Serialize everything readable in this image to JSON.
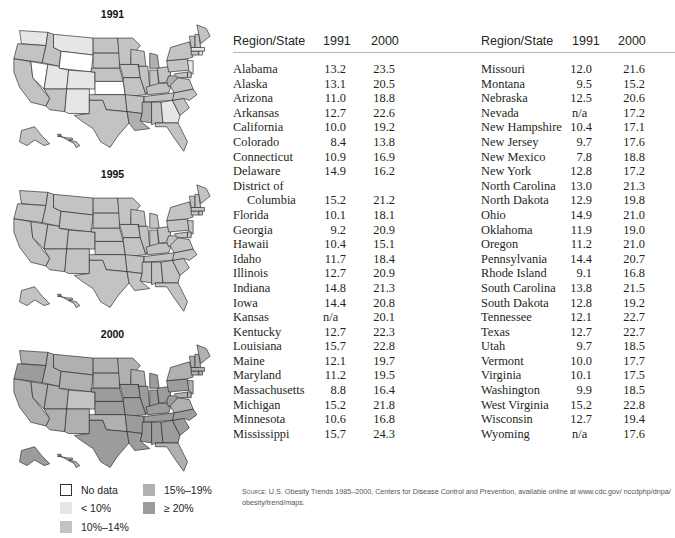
{
  "chart_data": [
    {
      "type": "heatmap",
      "title": "1991",
      "description": "Choropleth map of U.S. obesity prevalence by state, 1991",
      "legend": [
        "No data",
        "< 10%",
        "10%–14%",
        "15%–19%",
        "≥ 20%"
      ]
    },
    {
      "type": "heatmap",
      "title": "1995",
      "description": "Choropleth map of U.S. obesity prevalence by state, 1995",
      "legend": [
        "No data",
        "< 10%",
        "10%–14%",
        "15%–19%",
        "≥ 20%"
      ]
    },
    {
      "type": "heatmap",
      "title": "2000",
      "description": "Choropleth map of U.S. obesity prevalence by state, 2000",
      "legend": [
        "No data",
        "< 10%",
        "10%–14%",
        "15%–19%",
        "≥ 20%"
      ]
    },
    {
      "type": "table",
      "columns": [
        "Region/State",
        "1991",
        "2000"
      ],
      "rows": [
        [
          "Alabama",
          "13.2",
          "23.5"
        ],
        [
          "Alaska",
          "13.1",
          "20.5"
        ],
        [
          "Arizona",
          "11.0",
          "18.8"
        ],
        [
          "Arkansas",
          "12.7",
          "22.6"
        ],
        [
          "California",
          "10.0",
          "19.2"
        ],
        [
          "Colorado",
          "8.4",
          "13.8"
        ],
        [
          "Connecticut",
          "10.9",
          "16.9"
        ],
        [
          "Delaware",
          "14.9",
          "16.2"
        ],
        [
          "District of Columbia",
          "15.2",
          "21.2"
        ],
        [
          "Florida",
          "10.1",
          "18.1"
        ],
        [
          "Georgia",
          "9.2",
          "20.9"
        ],
        [
          "Hawaii",
          "10.4",
          "15.1"
        ],
        [
          "Idaho",
          "11.7",
          "18.4"
        ],
        [
          "Illinois",
          "12.7",
          "20.9"
        ],
        [
          "Indiana",
          "14.8",
          "21.3"
        ],
        [
          "Iowa",
          "14.4",
          "20.8"
        ],
        [
          "Kansas",
          "n/a",
          "20.1"
        ],
        [
          "Kentucky",
          "12.7",
          "22.3"
        ],
        [
          "Louisiana",
          "15.7",
          "22.8"
        ],
        [
          "Maine",
          "12.1",
          "19.7"
        ],
        [
          "Maryland",
          "11.2",
          "19.5"
        ],
        [
          "Massachusetts",
          "8.8",
          "16.4"
        ],
        [
          "Michigan",
          "15.2",
          "21.8"
        ],
        [
          "Minnesota",
          "10.6",
          "16.8"
        ],
        [
          "Mississippi",
          "15.7",
          "24.3"
        ],
        [
          "Missouri",
          "12.0",
          "21.6"
        ],
        [
          "Montana",
          "9.5",
          "15.2"
        ],
        [
          "Nebraska",
          "12.5",
          "20.6"
        ],
        [
          "Nevada",
          "n/a",
          "17.2"
        ],
        [
          "New Hampshire",
          "10.4",
          "17.1"
        ],
        [
          "New Jersey",
          "9.7",
          "17.6"
        ],
        [
          "New Mexico",
          "7.8",
          "18.8"
        ],
        [
          "New York",
          "12.8",
          "17.2"
        ],
        [
          "North Carolina",
          "13.0",
          "21.3"
        ],
        [
          "North Dakota",
          "12.9",
          "19.8"
        ],
        [
          "Ohio",
          "14.9",
          "21.0"
        ],
        [
          "Oklahoma",
          "11.9",
          "19.0"
        ],
        [
          "Oregon",
          "11.2",
          "21.0"
        ],
        [
          "Pennsylvania",
          "14.4",
          "20.7"
        ],
        [
          "Rhode Island",
          "9.1",
          "16.8"
        ],
        [
          "South Carolina",
          "13.8",
          "21.5"
        ],
        [
          "South Dakota",
          "12.8",
          "19.2"
        ],
        [
          "Tennessee",
          "12.1",
          "22.7"
        ],
        [
          "Texas",
          "12.7",
          "22.7"
        ],
        [
          "Utah",
          "9.7",
          "18.5"
        ],
        [
          "Vermont",
          "10.0",
          "17.7"
        ],
        [
          "Virginia",
          "10.1",
          "17.5"
        ],
        [
          "Washington",
          "9.9",
          "18.5"
        ],
        [
          "West Virginia",
          "15.2",
          "22.8"
        ],
        [
          "Wisconsin",
          "12.7",
          "19.4"
        ],
        [
          "Wyoming",
          "n/a",
          "17.6"
        ]
      ]
    }
  ],
  "colors": {
    "no_data": "#ffffff",
    "lt10": "#e6e6e6",
    "p10_14": "#c3c3c3",
    "p15_19": "#b0b0b0",
    "ge20": "#9c9c9c",
    "border": "#2a2a2a"
  },
  "maps": [
    {
      "title": "1991"
    },
    {
      "title": "1995"
    },
    {
      "title": "2000"
    }
  ],
  "legend": {
    "items": [
      {
        "label": "No data"
      },
      {
        "label": "< 10%"
      },
      {
        "label": "10%–14%"
      },
      {
        "label": "15%–19%"
      },
      {
        "label": "≥ 20%"
      }
    ]
  },
  "table": {
    "headers": {
      "region": "Region/State",
      "y1991": "1991",
      "y2000": "2000"
    },
    "left": [
      {
        "name": "Alabama",
        "v1991": "13.2",
        "v2000": "23.5"
      },
      {
        "name": "Alaska",
        "v1991": "13.1",
        "v2000": "20.5"
      },
      {
        "name": "Arizona",
        "v1991": "11.0",
        "v2000": "18.8"
      },
      {
        "name": "Arkansas",
        "v1991": "12.7",
        "v2000": "22.6"
      },
      {
        "name": "California",
        "v1991": "10.0",
        "v2000": "19.2"
      },
      {
        "name": "Colorado",
        "v1991": "8.4",
        "v2000": "13.8"
      },
      {
        "name": "Connecticut",
        "v1991": "10.9",
        "v2000": "16.9"
      },
      {
        "name": "Delaware",
        "v1991": "14.9",
        "v2000": "16.2"
      },
      {
        "name": "District of",
        "v1991": "",
        "v2000": ""
      },
      {
        "name": "Columbia",
        "v1991": "15.2",
        "v2000": "21.2",
        "indent": true
      },
      {
        "name": "Florida",
        "v1991": "10.1",
        "v2000": "18.1"
      },
      {
        "name": "Georgia",
        "v1991": "9.2",
        "v2000": "20.9"
      },
      {
        "name": "Hawaii",
        "v1991": "10.4",
        "v2000": "15.1"
      },
      {
        "name": "Idaho",
        "v1991": "11.7",
        "v2000": "18.4"
      },
      {
        "name": "Illinois",
        "v1991": "12.7",
        "v2000": "20.9"
      },
      {
        "name": "Indiana",
        "v1991": "14.8",
        "v2000": "21.3"
      },
      {
        "name": "Iowa",
        "v1991": "14.4",
        "v2000": "20.8"
      },
      {
        "name": "Kansas",
        "v1991": "n/a",
        "v2000": "20.1"
      },
      {
        "name": "Kentucky",
        "v1991": "12.7",
        "v2000": "22.3"
      },
      {
        "name": "Louisiana",
        "v1991": "15.7",
        "v2000": "22.8"
      },
      {
        "name": "Maine",
        "v1991": "12.1",
        "v2000": "19.7"
      },
      {
        "name": "Maryland",
        "v1991": "11.2",
        "v2000": "19.5"
      },
      {
        "name": "Massachusetts",
        "v1991": "8.8",
        "v2000": "16.4"
      },
      {
        "name": "Michigan",
        "v1991": "15.2",
        "v2000": "21.8"
      },
      {
        "name": "Minnesota",
        "v1991": "10.6",
        "v2000": "16.8"
      },
      {
        "name": "Mississippi",
        "v1991": "15.7",
        "v2000": "24.3"
      }
    ],
    "right": [
      {
        "name": "Missouri",
        "v1991": "12.0",
        "v2000": "21.6"
      },
      {
        "name": "Montana",
        "v1991": "9.5",
        "v2000": "15.2"
      },
      {
        "name": "Nebraska",
        "v1991": "12.5",
        "v2000": "20.6"
      },
      {
        "name": "Nevada",
        "v1991": "n/a",
        "v2000": "17.2"
      },
      {
        "name": "New Hampshire",
        "v1991": "10.4",
        "v2000": "17.1"
      },
      {
        "name": "New Jersey",
        "v1991": "9.7",
        "v2000": "17.6"
      },
      {
        "name": "New Mexico",
        "v1991": "7.8",
        "v2000": "18.8"
      },
      {
        "name": "New York",
        "v1991": "12.8",
        "v2000": "17.2"
      },
      {
        "name": "North Carolina",
        "v1991": "13.0",
        "v2000": "21.3"
      },
      {
        "name": "North Dakota",
        "v1991": "12.9",
        "v2000": "19.8"
      },
      {
        "name": "Ohio",
        "v1991": "14.9",
        "v2000": "21.0"
      },
      {
        "name": "Oklahoma",
        "v1991": "11.9",
        "v2000": "19.0"
      },
      {
        "name": "Oregon",
        "v1991": "11.2",
        "v2000": "21.0"
      },
      {
        "name": "Pennsylvania",
        "v1991": "14.4",
        "v2000": "20.7"
      },
      {
        "name": "Rhode Island",
        "v1991": "9.1",
        "v2000": "16.8"
      },
      {
        "name": "South Carolina",
        "v1991": "13.8",
        "v2000": "21.5"
      },
      {
        "name": "South Dakota",
        "v1991": "12.8",
        "v2000": "19.2"
      },
      {
        "name": "Tennessee",
        "v1991": "12.1",
        "v2000": "22.7"
      },
      {
        "name": "Texas",
        "v1991": "12.7",
        "v2000": "22.7"
      },
      {
        "name": "Utah",
        "v1991": "9.7",
        "v2000": "18.5"
      },
      {
        "name": "Vermont",
        "v1991": "10.0",
        "v2000": "17.7"
      },
      {
        "name": "Virginia",
        "v1991": "10.1",
        "v2000": "17.5"
      },
      {
        "name": "Washington",
        "v1991": "9.9",
        "v2000": "18.5"
      },
      {
        "name": "West Virginia",
        "v1991": "15.2",
        "v2000": "22.8"
      },
      {
        "name": "Wisconsin",
        "v1991": "12.7",
        "v2000": "19.4"
      },
      {
        "name": "Wyoming",
        "v1991": "n/a",
        "v2000": "17.6"
      }
    ]
  },
  "source": {
    "label": "Source:",
    "text": "U.S. Obesity Trends 1985–2000, Centers for Disease Control and Prevention, available online at www.cdc.gov/ nccdphp/dnpa/ obesity/trend/maps."
  }
}
